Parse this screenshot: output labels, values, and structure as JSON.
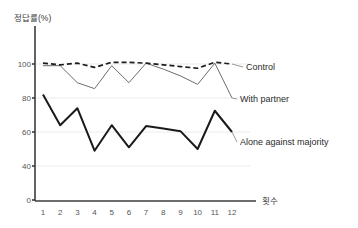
{
  "chart_data": {
    "type": "line",
    "title": "",
    "subtitle": "",
    "ylabel": "정답률(%)",
    "xlabel": "횟수",
    "categories": [
      "1",
      "2",
      "3",
      "4",
      "5",
      "6",
      "7",
      "8",
      "9",
      "10",
      "11",
      "12"
    ],
    "x": [
      1,
      2,
      3,
      4,
      5,
      6,
      7,
      8,
      9,
      10,
      11,
      12
    ],
    "yticks": [
      0,
      40,
      60,
      80,
      100
    ],
    "ytick_labels": [
      "0",
      "40",
      "60",
      "80",
      "100"
    ],
    "ylim": [
      0,
      105
    ],
    "axis_break": true,
    "grid": "horizontal-light",
    "legend_position": "right-inline",
    "series": [
      {
        "name": "Control",
        "style": "dashed",
        "color": "#1d1d1d",
        "values": [
          100.5,
          99.5,
          100.5,
          98.0,
          101.0,
          101.0,
          100.5,
          99.5,
          98.5,
          97.5,
          101.0,
          100.0
        ]
      },
      {
        "name": "With partner",
        "style": "thin-solid",
        "color": "#6d6d6d",
        "values": [
          99.0,
          99.0,
          89.0,
          85.5,
          99.0,
          89.0,
          100.5,
          97.0,
          93.0,
          88.0,
          100.5,
          80.0
        ]
      },
      {
        "name": "Alone against majority",
        "style": "bold-solid",
        "color": "#1a1a1a",
        "values": [
          82.0,
          64.0,
          74.0,
          49.0,
          64.0,
          51.0,
          63.5,
          62.0,
          60.5,
          50.0,
          72.5,
          60.0
        ]
      }
    ]
  },
  "legend": {
    "items": [
      {
        "label": "Control"
      },
      {
        "label": "With partner"
      },
      {
        "label": "Alone against majority"
      }
    ]
  }
}
